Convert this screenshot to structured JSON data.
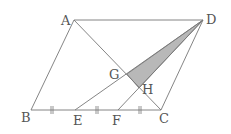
{
  "diagram": {
    "type": "geometry",
    "points": {
      "A": {
        "label": "A",
        "x": 74,
        "y": 20
      },
      "B": {
        "label": "B",
        "x": 31,
        "y": 110
      },
      "C": {
        "label": "C",
        "x": 161,
        "y": 110
      },
      "D": {
        "label": "D",
        "x": 203,
        "y": 20
      },
      "E": {
        "label": "E",
        "x": 75,
        "y": 110
      },
      "F": {
        "label": "F",
        "x": 118,
        "y": 110
      },
      "G": {
        "label": "G",
        "x": 127,
        "y": 74
      },
      "H": {
        "label": "H",
        "x": 139,
        "y": 88
      }
    },
    "segments": [
      "AB",
      "BC",
      "CD",
      "DA",
      "AC",
      "DE",
      "DF"
    ],
    "equal_marks": [
      "BE",
      "EF",
      "FC"
    ],
    "shaded_region": "DGH",
    "colors": {
      "line": "#777777",
      "shade": "#b8b8b8",
      "label": "#555555"
    }
  }
}
